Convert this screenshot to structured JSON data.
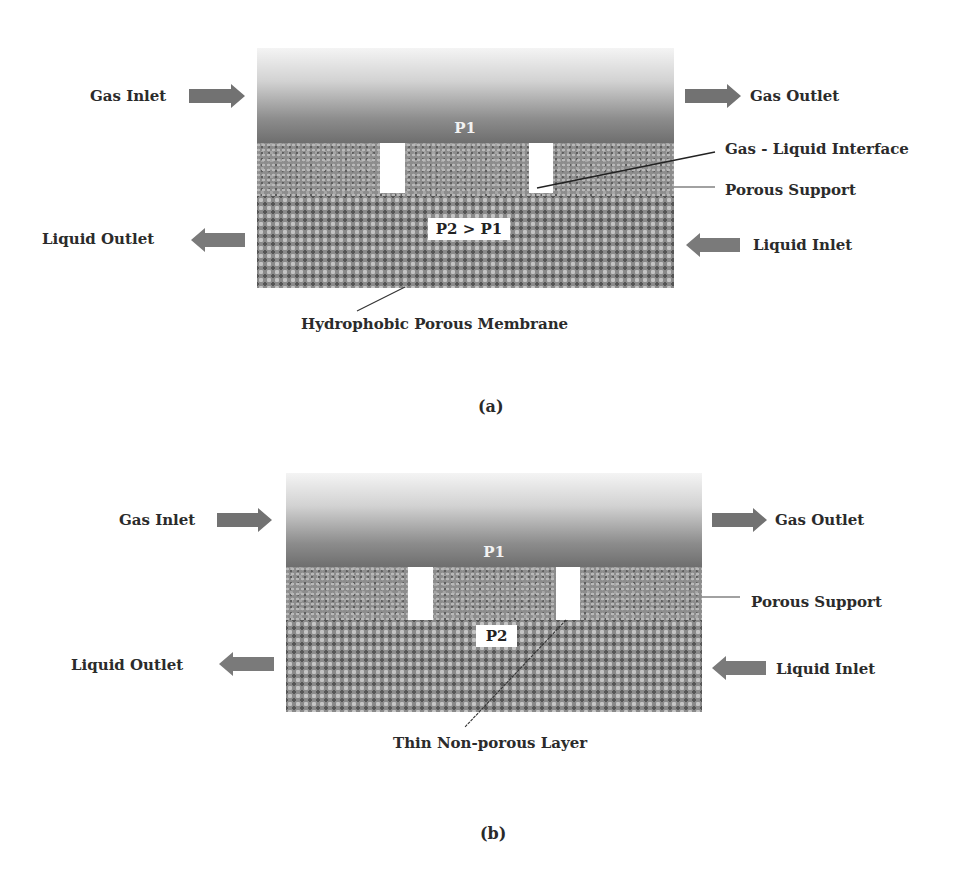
{
  "figure_a": {
    "caption": "(a)",
    "pressure_top": "P1",
    "pressure_bottom": "P2 > P1",
    "labels": {
      "gas_inlet": "Gas Inlet",
      "gas_outlet": "Gas Outlet",
      "liquid_outlet": "Liquid Outlet",
      "liquid_inlet": "Liquid Inlet",
      "interface": "Gas - Liquid Interface",
      "porous_support": "Porous Support",
      "membrane": "Hydrophobic Porous Membrane"
    }
  },
  "figure_b": {
    "caption": "(b)",
    "pressure_top": "P1",
    "pressure_bottom": "P2",
    "labels": {
      "gas_inlet": "Gas Inlet",
      "gas_outlet": "Gas Outlet",
      "liquid_outlet": "Liquid Outlet",
      "liquid_inlet": "Liquid Inlet",
      "porous_support": "Porous Support",
      "layer": "Thin Non-porous Layer"
    }
  },
  "colors": {
    "arrow": "#727272",
    "text": "#2b2b2b",
    "gas_dark": "#6e6e6e",
    "gas_light": "#f4f4f4"
  }
}
